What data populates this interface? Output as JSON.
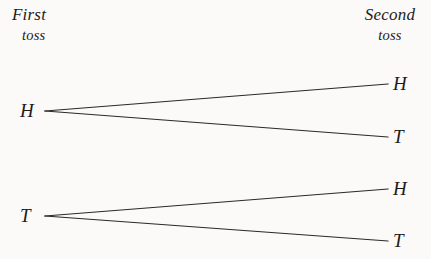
{
  "diagram": {
    "type": "probability-tree",
    "background_color": "#fbfaf8",
    "line_color": "#2b2926",
    "text_color": "#1d1b1a",
    "columns": [
      {
        "id": "first",
        "heading": "First",
        "subheading": "toss"
      },
      {
        "id": "second",
        "heading": "Second",
        "subheading": "toss"
      }
    ],
    "nodes": {
      "first_toss": [
        {
          "id": "n-h",
          "label": "H"
        },
        {
          "id": "n-t",
          "label": "T"
        }
      ],
      "second_toss": [
        {
          "id": "n-hh",
          "label": "H",
          "parent": "n-h"
        },
        {
          "id": "n-ht",
          "label": "T",
          "parent": "n-h"
        },
        {
          "id": "n-th",
          "label": "H",
          "parent": "n-t"
        },
        {
          "id": "n-tt",
          "label": "T",
          "parent": "n-t"
        }
      ]
    },
    "branches": [
      {
        "from": "n-h",
        "to": "n-hh"
      },
      {
        "from": "n-h",
        "to": "n-ht"
      },
      {
        "from": "n-t",
        "to": "n-th"
      },
      {
        "from": "n-t",
        "to": "n-tt"
      }
    ]
  }
}
